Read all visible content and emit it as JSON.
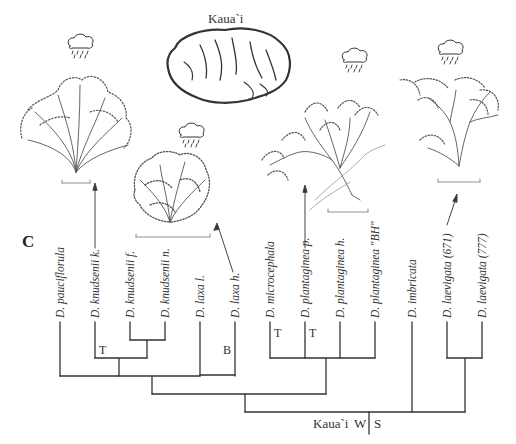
{
  "figure": {
    "panel_letter": "C",
    "island_map": {
      "title": "Kaua`i",
      "icon": "kauai-island-map"
    },
    "root": {
      "island": "Kaua`i",
      "left_label": "W",
      "right_label": "S"
    },
    "branch_marks": [
      {
        "label": "T",
        "near": "D. knudsenii k."
      },
      {
        "label": "B",
        "near": "D. laxa h."
      },
      {
        "label": "T",
        "near": "D. microcephala"
      },
      {
        "label": "T",
        "near": "D. plantaginea p."
      }
    ],
    "taxa": [
      {
        "label": "D. pauciflorula"
      },
      {
        "label": "D. knudsenii k."
      },
      {
        "label": "D. knudsenii f."
      },
      {
        "label": "D. knudsenii n."
      },
      {
        "label": "D. laxa l."
      },
      {
        "label": "D. laxa h."
      },
      {
        "label": "D. microcephala"
      },
      {
        "label": "D. plantaginea p."
      },
      {
        "label": "D. plantaginea h."
      },
      {
        "label": "D. plantaginea \"BH\""
      },
      {
        "label": "D. imbricata"
      },
      {
        "label": "D. laevigata (671)"
      },
      {
        "label": "D. laevigata (777)"
      }
    ],
    "illustrations": [
      {
        "name": "shrub-illustration-knudsenii",
        "habitat_icon": "rain-cloud-icon",
        "points_to": "D. knudsenii k."
      },
      {
        "name": "shrub-illustration-laxa",
        "habitat_icon": "rain-cloud-icon",
        "points_to": "D. laxa h."
      },
      {
        "name": "shrub-illustration-plantaginea",
        "habitat_icon": "rain-cloud-icon",
        "points_to": "D. plantaginea p."
      },
      {
        "name": "shrub-illustration-laevigata",
        "habitat_icon": "rain-cloud-icon",
        "points_to": "D. laevigata (671)"
      }
    ]
  }
}
